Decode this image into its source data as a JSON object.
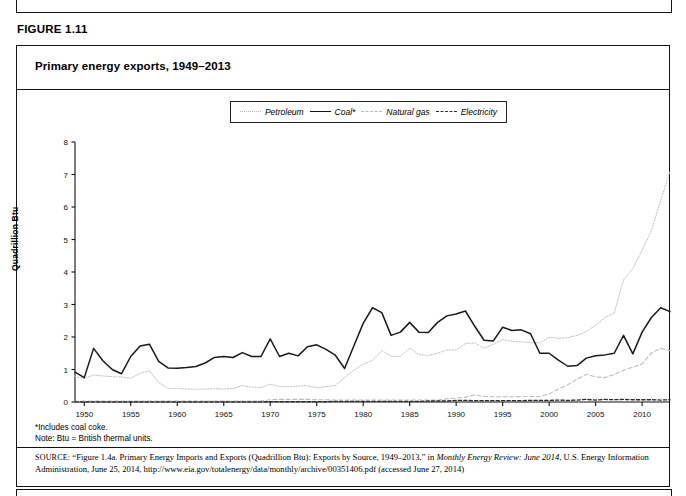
{
  "figure": {
    "label": "FIGURE 1.11",
    "title": "Primary energy exports, 1949–2013"
  },
  "footnotes": {
    "coal_coke": "*Includes coal coke.",
    "btu_note": "Note: Btu = British thermal units."
  },
  "source": {
    "keyword": "SOURCE:",
    "part1": " “Figure 1.4a. Primary Energy Imports and Exports (Quadrillion Btu): Exports by Source, 1949–2013,” in ",
    "italic1": "Monthly Energy Review: June 2014",
    "part2": ", U.S. Energy Information Administration, June 25, 2014, http://www.eia.gov/totalenergy/data/monthly/archive/00351406.pdf (accessed June 27, 2014)"
  },
  "colors": {
    "petroleum": "#c0c0c0",
    "coal": "#1a1a1a",
    "natural_gas": "#bdbdbd",
    "electricity": "#2b2b2b",
    "axis": "#111111",
    "frame": "#111111"
  },
  "chart_data": {
    "type": "line",
    "title": "Primary energy exports, 1949–2013",
    "xlabel": "",
    "ylabel": "Quadrillion Btu",
    "xlim": [
      1949,
      2013
    ],
    "ylim": [
      0,
      8
    ],
    "yticks": [
      0,
      1,
      2,
      3,
      4,
      5,
      6,
      7,
      8
    ],
    "xticks": [
      1950,
      1955,
      1960,
      1965,
      1970,
      1975,
      1980,
      1985,
      1990,
      1995,
      2000,
      2005,
      2010
    ],
    "grid": false,
    "legend_position": "top-center",
    "x": [
      1949,
      1950,
      1951,
      1952,
      1953,
      1954,
      1955,
      1956,
      1957,
      1958,
      1959,
      1960,
      1961,
      1962,
      1963,
      1964,
      1965,
      1966,
      1967,
      1968,
      1969,
      1970,
      1971,
      1972,
      1973,
      1974,
      1975,
      1976,
      1977,
      1978,
      1979,
      1980,
      1981,
      1982,
      1983,
      1984,
      1985,
      1986,
      1987,
      1988,
      1989,
      1990,
      1991,
      1992,
      1993,
      1994,
      1995,
      1996,
      1997,
      1998,
      1999,
      2000,
      2001,
      2002,
      2003,
      2004,
      2005,
      2006,
      2007,
      2008,
      2009,
      2010,
      2011,
      2012,
      2013
    ],
    "series": [
      {
        "name": "Petroleum",
        "style": "dotted",
        "color": "#c0c0c0",
        "values": [
          0.78,
          0.72,
          0.83,
          0.8,
          0.78,
          0.77,
          0.73,
          0.88,
          0.96,
          0.6,
          0.42,
          0.42,
          0.4,
          0.39,
          0.4,
          0.41,
          0.4,
          0.42,
          0.5,
          0.46,
          0.44,
          0.55,
          0.48,
          0.47,
          0.49,
          0.5,
          0.44,
          0.47,
          0.51,
          0.75,
          0.98,
          1.16,
          1.28,
          1.58,
          1.41,
          1.4,
          1.66,
          1.46,
          1.43,
          1.5,
          1.6,
          1.6,
          1.8,
          1.82,
          1.65,
          1.78,
          1.92,
          1.87,
          1.85,
          1.83,
          1.82,
          1.99,
          1.96,
          1.98,
          2.05,
          2.17,
          2.36,
          2.6,
          2.74,
          3.76,
          4.1,
          4.67,
          5.27,
          6.2,
          7.1
        ]
      },
      {
        "name": "Coal*",
        "style": "solid",
        "color": "#1a1a1a",
        "values": [
          0.92,
          0.75,
          1.65,
          1.27,
          1.0,
          0.87,
          1.4,
          1.72,
          1.78,
          1.25,
          1.05,
          1.04,
          1.06,
          1.09,
          1.2,
          1.37,
          1.4,
          1.37,
          1.52,
          1.4,
          1.4,
          1.94,
          1.4,
          1.5,
          1.42,
          1.7,
          1.76,
          1.62,
          1.44,
          1.03,
          1.73,
          2.42,
          2.9,
          2.75,
          2.05,
          2.15,
          2.45,
          2.15,
          2.14,
          2.45,
          2.65,
          2.71,
          2.8,
          2.33,
          1.9,
          1.88,
          2.3,
          2.2,
          2.22,
          2.1,
          1.5,
          1.5,
          1.29,
          1.1,
          1.12,
          1.35,
          1.42,
          1.45,
          1.5,
          2.05,
          1.48,
          2.15,
          2.6,
          2.9,
          2.78
        ]
      },
      {
        "name": "Natural gas",
        "style": "dashed",
        "color": "#bdbdbd",
        "values": [
          0.02,
          0.03,
          0.03,
          0.03,
          0.03,
          0.03,
          0.03,
          0.03,
          0.03,
          0.03,
          0.03,
          0.03,
          0.03,
          0.03,
          0.03,
          0.03,
          0.03,
          0.03,
          0.03,
          0.03,
          0.03,
          0.07,
          0.08,
          0.08,
          0.08,
          0.08,
          0.07,
          0.07,
          0.06,
          0.06,
          0.06,
          0.06,
          0.06,
          0.06,
          0.06,
          0.06,
          0.06,
          0.06,
          0.06,
          0.06,
          0.1,
          0.12,
          0.15,
          0.22,
          0.17,
          0.16,
          0.16,
          0.16,
          0.17,
          0.17,
          0.17,
          0.25,
          0.4,
          0.53,
          0.7,
          0.85,
          0.77,
          0.75,
          0.85,
          0.98,
          1.07,
          1.17,
          1.51,
          1.65,
          1.58
        ]
      },
      {
        "name": "Electricity",
        "style": "dashed",
        "color": "#2b2b2b",
        "values": [
          0.005,
          0.005,
          0.005,
          0.005,
          0.005,
          0.005,
          0.005,
          0.005,
          0.005,
          0.005,
          0.005,
          0.005,
          0.005,
          0.005,
          0.005,
          0.005,
          0.005,
          0.005,
          0.005,
          0.005,
          0.005,
          0.01,
          0.01,
          0.01,
          0.01,
          0.01,
          0.01,
          0.01,
          0.02,
          0.02,
          0.02,
          0.02,
          0.02,
          0.02,
          0.02,
          0.02,
          0.02,
          0.02,
          0.03,
          0.03,
          0.03,
          0.05,
          0.05,
          0.04,
          0.04,
          0.04,
          0.04,
          0.04,
          0.04,
          0.05,
          0.05,
          0.05,
          0.06,
          0.05,
          0.06,
          0.08,
          0.06,
          0.08,
          0.07,
          0.08,
          0.07,
          0.07,
          0.07,
          0.06,
          0.07
        ]
      }
    ]
  }
}
